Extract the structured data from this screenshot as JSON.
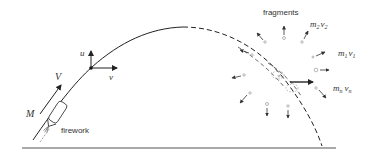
{
  "diagram": {
    "labels": {
      "fragments": "fragments",
      "firework": "firework",
      "mass": "M",
      "velocity": "V",
      "u_component": "u",
      "v_component": "v",
      "m2": "m",
      "m2_sub": "2",
      "v2": "v",
      "v2_sub": "2",
      "m1": "m",
      "m1_sub": "1",
      "v1": "v",
      "v1_sub": "1",
      "mn": "m",
      "mn_sub": "n",
      "vn": "v",
      "vn_sub": "n"
    },
    "colors": {
      "stroke": "#222222",
      "fragment": "#777777",
      "text": "#333333",
      "ground": "#555555"
    },
    "trajectory": {
      "solid": "firework ascent path",
      "dashed": "center-of-mass path after explosion"
    }
  }
}
